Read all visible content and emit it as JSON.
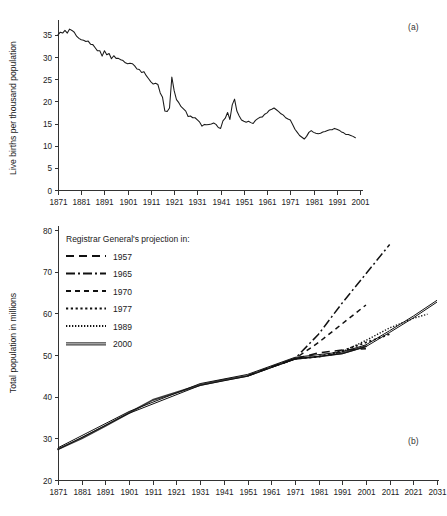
{
  "figure": {
    "panel_a_tag": "(a)",
    "panel_b_tag": "(b)",
    "top_cut_text": ""
  },
  "chart_data": [
    {
      "id": "births",
      "type": "line",
      "title": "",
      "xlabel": "",
      "ylabel": "Live births per thousand population",
      "xlim": [
        1871,
        2001
      ],
      "ylim": [
        0,
        37
      ],
      "grid": false,
      "legend": "none",
      "xticks": [
        1871,
        1881,
        1891,
        1901,
        1911,
        1921,
        1931,
        1941,
        1951,
        1961,
        1971,
        1981,
        1991,
        2001
      ],
      "yticks": [
        0,
        5,
        10,
        15,
        20,
        25,
        30,
        35
      ],
      "series": [
        {
          "name": "Live births per thousand population",
          "x": [
            1871,
            1872,
            1873,
            1874,
            1875,
            1876,
            1877,
            1878,
            1879,
            1880,
            1881,
            1882,
            1883,
            1884,
            1885,
            1886,
            1887,
            1888,
            1889,
            1890,
            1891,
            1892,
            1893,
            1894,
            1895,
            1896,
            1897,
            1898,
            1899,
            1900,
            1901,
            1902,
            1903,
            1904,
            1905,
            1906,
            1907,
            1908,
            1909,
            1910,
            1911,
            1912,
            1913,
            1914,
            1915,
            1916,
            1917,
            1918,
            1919,
            1920,
            1921,
            1922,
            1923,
            1924,
            1925,
            1926,
            1927,
            1928,
            1929,
            1930,
            1931,
            1932,
            1933,
            1934,
            1935,
            1936,
            1937,
            1938,
            1939,
            1940,
            1941,
            1942,
            1943,
            1944,
            1945,
            1946,
            1947,
            1948,
            1949,
            1950,
            1951,
            1952,
            1953,
            1954,
            1955,
            1956,
            1957,
            1958,
            1959,
            1960,
            1961,
            1962,
            1963,
            1964,
            1965,
            1966,
            1967,
            1968,
            1969,
            1970,
            1971,
            1972,
            1973,
            1974,
            1975,
            1976,
            1977,
            1978,
            1979,
            1980,
            1981,
            1982,
            1983,
            1984,
            1985,
            1986,
            1987,
            1988,
            1989,
            1990,
            1991,
            1992,
            1993,
            1994,
            1995,
            1996,
            1997,
            1998,
            1999
          ],
          "y": [
            35.0,
            35.6,
            35.4,
            36.0,
            35.4,
            36.3,
            36.0,
            35.6,
            34.7,
            34.2,
            33.9,
            33.8,
            33.5,
            33.6,
            32.9,
            32.8,
            32.1,
            31.4,
            31.4,
            30.2,
            31.4,
            30.5,
            30.8,
            29.6,
            30.3,
            29.7,
            29.7,
            29.4,
            29.2,
            28.7,
            28.5,
            28.6,
            28.5,
            28.0,
            27.3,
            27.2,
            26.5,
            26.7,
            25.8,
            25.1,
            24.4,
            23.9,
            24.1,
            23.8,
            21.9,
            20.9,
            17.8,
            17.7,
            18.5,
            25.5,
            22.4,
            20.4,
            19.7,
            18.8,
            18.3,
            17.8,
            16.6,
            16.7,
            16.3,
            16.3,
            15.8,
            15.3,
            14.4,
            14.8,
            14.7,
            14.8,
            14.9,
            15.1,
            14.8,
            14.1,
            13.9,
            15.6,
            16.2,
            17.5,
            15.9,
            19.2,
            20.5,
            17.8,
            16.7,
            15.8,
            15.5,
            15.3,
            15.5,
            15.2,
            15.0,
            15.7,
            16.1,
            16.4,
            16.5,
            17.1,
            17.4,
            18.0,
            18.2,
            18.5,
            18.1,
            17.7,
            17.2,
            16.9,
            16.3,
            16.0,
            15.8,
            14.8,
            13.7,
            13.0,
            12.3,
            11.9,
            11.5,
            12.1,
            13.0,
            13.4,
            13.0,
            12.8,
            12.7,
            12.8,
            13.1,
            13.2,
            13.4,
            13.6,
            13.6,
            13.9,
            13.7,
            13.5,
            13.1,
            12.9,
            12.5,
            12.5,
            12.3,
            12.1,
            11.8
          ]
        }
      ]
    },
    {
      "id": "population",
      "type": "line",
      "title": "",
      "xlabel": "",
      "ylabel": "Total population in millions",
      "xlim": [
        1871,
        2031
      ],
      "ylim": [
        20,
        80
      ],
      "grid": false,
      "legend_title": "Registrar General's projection in:",
      "legend_position": "upper-left",
      "xticks": [
        1871,
        1881,
        1891,
        1901,
        1911,
        1921,
        1931,
        1941,
        1951,
        1961,
        1971,
        1981,
        1991,
        2001,
        2011,
        2021,
        2031
      ],
      "yticks": [
        20,
        30,
        40,
        50,
        60,
        70,
        80
      ],
      "series": [
        {
          "name": "Actual population",
          "style": "solid-thick",
          "x": [
            1871,
            1881,
            1891,
            1901,
            1911,
            1921,
            1931,
            1941,
            1951,
            1961,
            1971,
            1981,
            1991,
            2001
          ],
          "y": [
            27.4,
            30.0,
            33.0,
            36.1,
            39.2,
            41.0,
            42.8,
            44.0,
            45.0,
            47.1,
            49.1,
            49.6,
            50.4,
            52.1
          ]
        },
        {
          "name": "1957",
          "style": "dashed-long",
          "x": [
            1951,
            1961,
            1971,
            1981,
            1991,
            2001
          ],
          "y": [
            45.0,
            47.1,
            49.1,
            50.5,
            51.2,
            51.5
          ]
        },
        {
          "name": "1965",
          "style": "dash-dot",
          "x": [
            1961,
            1971,
            1981,
            1991,
            2001,
            2011
          ],
          "y": [
            47.1,
            49.1,
            55.0,
            62.5,
            69.5,
            76.5
          ]
        },
        {
          "name": "1970",
          "style": "dashed-medium",
          "x": [
            1966,
            1971,
            1981,
            1991,
            2001
          ],
          "y": [
            48.0,
            49.1,
            53.0,
            57.5,
            62.0
          ]
        },
        {
          "name": "1977",
          "style": "dotted-coarse",
          "x": [
            1971,
            1981,
            1991,
            2001,
            2011
          ],
          "y": [
            49.1,
            49.6,
            51.0,
            53.0,
            55.0
          ]
        },
        {
          "name": "1989",
          "style": "dotted-fine",
          "x": [
            1986,
            1991,
            2001,
            2011,
            2021,
            2027
          ],
          "y": [
            50.0,
            50.8,
            53.5,
            56.5,
            58.8,
            59.8
          ]
        },
        {
          "name": "2000",
          "style": "double-solid",
          "x": [
            1871,
            1901,
            1931,
            1951,
            1971,
            1991,
            2001,
            2011,
            2021,
            2031
          ],
          "y": [
            27.4,
            36.1,
            42.8,
            45.0,
            49.1,
            50.4,
            52.1,
            55.5,
            59.0,
            62.8
          ]
        }
      ],
      "legend_entries": [
        {
          "label": "1957",
          "style": "dashed-long"
        },
        {
          "label": "1965",
          "style": "dash-dot"
        },
        {
          "label": "1970",
          "style": "dashed-medium"
        },
        {
          "label": "1977",
          "style": "dotted-coarse"
        },
        {
          "label": "1989",
          "style": "dotted-fine"
        },
        {
          "label": "2000",
          "style": "double-solid"
        }
      ]
    }
  ]
}
